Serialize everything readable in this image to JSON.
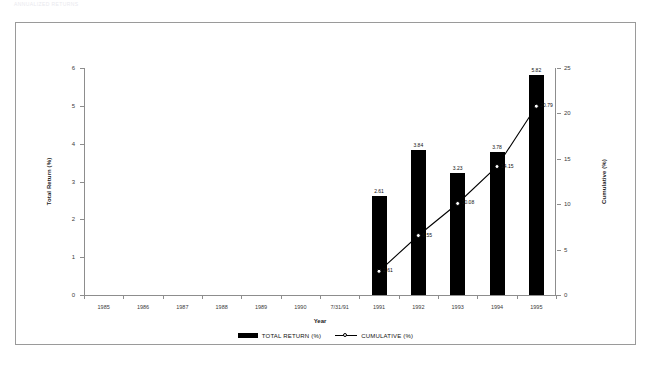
{
  "document": {
    "header_text": "ANNUALIZED RETURNS"
  },
  "chart_data": {
    "type": "bar",
    "title": "",
    "xlabel": "Year",
    "ylabel": "Total Return (%)",
    "y2label": "Cumulative (%)",
    "categories": [
      "1985",
      "1986",
      "1987",
      "1988",
      "1989",
      "1990",
      "7/31/91",
      "1991",
      "1992",
      "1993",
      "1994",
      "1995"
    ],
    "ylim": [
      0,
      6
    ],
    "y2lim": [
      0,
      25
    ],
    "yticks": [
      "0",
      "1",
      "2",
      "3",
      "4",
      "5",
      "6"
    ],
    "y2ticks": [
      "0",
      "5",
      "10",
      "15",
      "20",
      "25"
    ],
    "grid": false,
    "legend_position": "bottom-center",
    "series": [
      {
        "name": "TOTAL RETURN (%)",
        "type": "bar",
        "axis": "left",
        "color": "#000000",
        "values": [
          null,
          null,
          null,
          null,
          null,
          null,
          null,
          2.61,
          3.84,
          3.23,
          3.78,
          5.82
        ],
        "labels": [
          "",
          "",
          "",
          "",
          "",
          "",
          "",
          "2.61",
          "3.84",
          "3.23",
          "3.78",
          "5.82"
        ]
      },
      {
        "name": "CUMULATIVE (%)",
        "type": "line",
        "axis": "right",
        "color": "#000000",
        "marker": "open-circle",
        "values": [
          null,
          null,
          null,
          null,
          null,
          null,
          null,
          2.61,
          6.55,
          10.08,
          14.15,
          20.79
        ],
        "labels": [
          "",
          "",
          "",
          "",
          "",
          "",
          "",
          "2.61",
          "6.55",
          "10.08",
          "14.15",
          "20.79"
        ]
      }
    ]
  },
  "legend": {
    "items": [
      {
        "label": "TOTAL RETURN (%)",
        "marker": "bar-swatch"
      },
      {
        "label": "CUMULATIVE (%)",
        "marker": "line-circle-swatch"
      }
    ]
  }
}
